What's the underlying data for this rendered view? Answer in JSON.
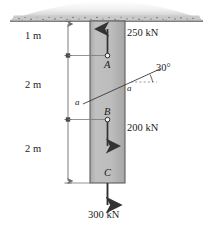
{
  "figure": {
    "background_color": "#ffffff",
    "column_fill_color": "#b9b9b9",
    "column_edge_color": "#5a5a5a",
    "ground_color": "#8f8f8f",
    "line_color": "#3a3a3a",
    "dim_line_color": "#6e6e6e"
  },
  "ground": {
    "label": "ground-surface",
    "hatch_style": "stippled"
  },
  "dimensions": [
    {
      "label": "1 m",
      "from": "ground",
      "to": "A"
    },
    {
      "label": "2 m",
      "from": "A",
      "to": "B"
    },
    {
      "label": "2 m",
      "from": "B",
      "to": "C"
    }
  ],
  "points": [
    {
      "label": "A",
      "load": "250 kN",
      "direction": "up"
    },
    {
      "label": "B",
      "load": "200 kN",
      "direction": "down"
    },
    {
      "label": "C",
      "load": "300 kN",
      "direction": "down"
    }
  ],
  "loads": {
    "at_a": "250 kN",
    "at_b": "200 kN",
    "at_c": "300 kN"
  },
  "section": {
    "left_label": "a",
    "right_label": "a",
    "angle_label": "30°",
    "angle_value": 30
  }
}
